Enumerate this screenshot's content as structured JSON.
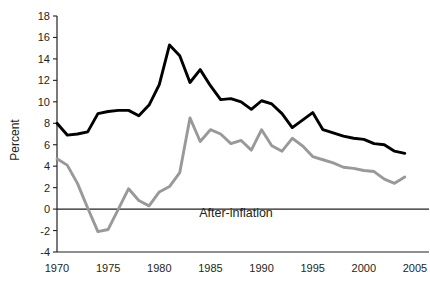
{
  "chart_data": {
    "type": "line",
    "title": "",
    "subtitle": "",
    "xlabel": "",
    "ylabel": "Percent",
    "xlim": [
      1969,
      2006
    ],
    "ylim": [
      -4,
      18
    ],
    "ytick_step": 2,
    "grid": false,
    "legend_position": "inline-annotation",
    "zero_line": 0,
    "x_tick_labels": [
      "1970",
      "1975",
      "1980",
      "1985",
      "1990",
      "1995",
      "2000",
      "2005"
    ],
    "x_ticks": [
      1970,
      1975,
      1980,
      1985,
      1990,
      1995,
      2000,
      2005
    ],
    "y_tick_labels": [
      "18",
      "16",
      "14",
      "12",
      "10",
      "8",
      "6",
      "4",
      "2",
      "0",
      "-2",
      "-4"
    ],
    "y_ticks": [
      18,
      16,
      14,
      12,
      10,
      8,
      6,
      4,
      2,
      0,
      -2,
      -4
    ],
    "annotations": [
      {
        "text": "After-inflation",
        "x": 1987.5,
        "y": -0.7
      }
    ],
    "colors": {
      "nominal_series": "#000000",
      "real_series": "#999999",
      "axis": "#231f20",
      "background": "#ffffff"
    },
    "x": [
      1970,
      1971,
      1972,
      1973,
      1974,
      1975,
      1976,
      1977,
      1978,
      1979,
      1980,
      1981,
      1982,
      1983,
      1984,
      1985,
      1986,
      1987,
      1988,
      1989,
      1990,
      1991,
      1992,
      1993,
      1994,
      1995,
      1996,
      1997,
      1998,
      1999,
      2000,
      2001,
      2002,
      2003,
      2004
    ],
    "series": [
      {
        "name": "Nominal",
        "color": "#000000",
        "values": [
          8.0,
          6.9,
          7.0,
          7.2,
          8.9,
          9.1,
          9.2,
          9.2,
          8.7,
          9.7,
          11.6,
          15.3,
          14.3,
          11.8,
          13.0,
          11.5,
          10.2,
          10.3,
          10.0,
          9.3,
          10.1,
          9.8,
          8.9,
          7.6,
          8.3,
          9.0,
          7.4,
          7.1,
          6.8,
          6.6,
          6.5,
          6.1,
          6.0,
          5.4,
          5.2
        ]
      },
      {
        "name": "After-inflation",
        "color": "#999999",
        "values": [
          4.7,
          4.1,
          2.4,
          0.1,
          -2.1,
          -1.9,
          0.0,
          1.9,
          0.8,
          0.3,
          1.6,
          2.1,
          3.4,
          8.5,
          6.3,
          7.4,
          7.0,
          6.1,
          6.4,
          5.5,
          7.4,
          5.9,
          5.4,
          6.6,
          5.9,
          4.9,
          4.6,
          4.3,
          3.9,
          3.8,
          3.6,
          3.5,
          2.8,
          2.4,
          3.0
        ]
      }
    ]
  }
}
